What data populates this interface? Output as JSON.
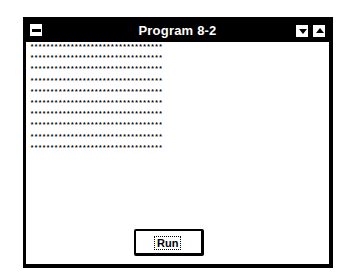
{
  "window": {
    "title": "Program 8-2",
    "controls": {
      "system_menu": "system-menu",
      "minimize": "minimize",
      "maximize": "maximize"
    }
  },
  "output": {
    "rows": [
      "*********************************",
      "*********************************",
      "*********************************",
      "*********************************",
      "*********************************",
      "*********************************",
      "*********************************",
      "*********************************",
      "*********************************",
      "*********************************"
    ]
  },
  "buttons": {
    "run_label": "Run"
  },
  "colors": {
    "titlebar": "#000000",
    "title_text": "#ffffff",
    "client_bg": "#ffffff"
  }
}
